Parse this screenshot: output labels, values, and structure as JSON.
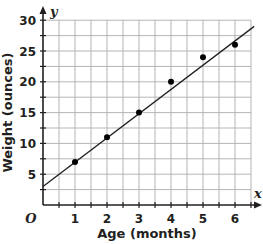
{
  "chart_data": {
    "type": "scatter",
    "title": "",
    "xlabel": "Age (months)",
    "ylabel": "Weight (ounces)",
    "x_axis_var": "x",
    "y_axis_var": "y",
    "origin_label": "O",
    "x": [
      1,
      2,
      3,
      4,
      5,
      6
    ],
    "values": [
      7,
      11,
      15,
      20,
      24,
      26
    ],
    "series": [
      {
        "name": "data points",
        "x": [
          1,
          2,
          3,
          4,
          5,
          6
        ],
        "y": [
          7,
          11,
          15,
          20,
          24,
          26
        ]
      }
    ],
    "trend_line": {
      "type": "line of best fit",
      "x_start": 0,
      "y_start": 3,
      "x_end": 6.6,
      "y_end": 29
    },
    "x_ticks": [
      "1",
      "2",
      "3",
      "4",
      "5",
      "6"
    ],
    "y_ticks": [
      "5",
      "10",
      "15",
      "20",
      "25",
      "30"
    ],
    "xlim": [
      0,
      6.5
    ],
    "ylim": [
      0,
      30
    ],
    "grid": true,
    "legend": null
  }
}
